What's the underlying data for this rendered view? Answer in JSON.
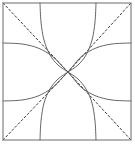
{
  "figure": {
    "title": "",
    "width": 135,
    "height": 145,
    "background_color": "#ffffff"
  },
  "frame": {
    "name": "plot-border",
    "x": 3,
    "y": 3,
    "width": 128,
    "height": 137,
    "stroke_color": "#6b6b6b",
    "stroke_width": 1,
    "fill": "none"
  },
  "chart_data": {
    "type": "line",
    "title": "",
    "subtitle": "",
    "xlabel": "",
    "ylabel": "",
    "xlim": [
      3,
      131
    ],
    "ylim": [
      3,
      140
    ],
    "grid": false,
    "legend": "none",
    "axis_ticks": [],
    "tick_labels": [],
    "annotations": [],
    "center_point": {
      "name": "convergence-point",
      "x": 68,
      "y": 72
    },
    "curve_stroke_color": "#555555",
    "curve_stroke_width": 0.9,
    "asymptote_stroke_color": "#3a3a3a",
    "asymptote_stroke_width": 1,
    "asymptote_dash": "2,2.4",
    "series": [
      {
        "name": "asymptote-diagonal-nw-se",
        "style": "dashed",
        "points": [
          [
            3,
            3
          ],
          [
            68,
            72
          ],
          [
            131,
            140
          ]
        ]
      },
      {
        "name": "asymptote-diagonal-sw-ne",
        "style": "dashed",
        "points": [
          [
            3,
            140
          ],
          [
            68,
            72
          ],
          [
            131,
            3
          ]
        ]
      },
      {
        "name": "steep-curve-upper-left",
        "style": "solid",
        "points": [
          [
            40,
            3
          ],
          [
            41,
            22
          ],
          [
            44,
            40
          ],
          [
            50,
            55
          ],
          [
            58,
            65
          ],
          [
            68,
            72
          ]
        ]
      },
      {
        "name": "steep-curve-upper-right",
        "style": "solid",
        "points": [
          [
            96,
            3
          ],
          [
            95,
            22
          ],
          [
            92,
            40
          ],
          [
            86,
            55
          ],
          [
            78,
            65
          ],
          [
            68,
            72
          ]
        ]
      },
      {
        "name": "steep-curve-lower-left",
        "style": "solid",
        "points": [
          [
            40,
            140
          ],
          [
            41,
            121
          ],
          [
            44,
            103
          ],
          [
            50,
            89
          ],
          [
            58,
            79
          ],
          [
            68,
            72
          ]
        ]
      },
      {
        "name": "steep-curve-lower-right",
        "style": "solid",
        "points": [
          [
            96,
            140
          ],
          [
            95,
            121
          ],
          [
            92,
            103
          ],
          [
            86,
            89
          ],
          [
            78,
            79
          ],
          [
            68,
            72
          ]
        ]
      },
      {
        "name": "shallow-curve-left-upper",
        "style": "solid",
        "points": [
          [
            3,
            43
          ],
          [
            22,
            44
          ],
          [
            38,
            48
          ],
          [
            52,
            56
          ],
          [
            62,
            66
          ],
          [
            68,
            72
          ]
        ]
      },
      {
        "name": "shallow-curve-right-upper",
        "style": "solid",
        "points": [
          [
            131,
            43
          ],
          [
            112,
            44
          ],
          [
            96,
            48
          ],
          [
            82,
            56
          ],
          [
            73,
            66
          ],
          [
            68,
            72
          ]
        ]
      },
      {
        "name": "shallow-curve-left-lower",
        "style": "solid",
        "points": [
          [
            3,
            101
          ],
          [
            22,
            100
          ],
          [
            38,
            96
          ],
          [
            52,
            88
          ],
          [
            62,
            78
          ],
          [
            68,
            72
          ]
        ]
      },
      {
        "name": "shallow-curve-right-lower",
        "style": "solid",
        "points": [
          [
            131,
            101
          ],
          [
            112,
            100
          ],
          [
            96,
            96
          ],
          [
            82,
            88
          ],
          [
            73,
            78
          ],
          [
            68,
            72
          ]
        ]
      }
    ]
  }
}
